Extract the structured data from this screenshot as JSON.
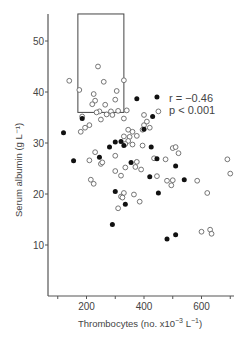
{
  "chart_data": {
    "type": "scatter",
    "title": "",
    "xlabel": "Thrombocytes (no. x10⁻³ L⁻¹)",
    "ylabel": "Serum albumin (g L⁻¹)",
    "xlim": [
      0,
      900
    ],
    "ylim": [
      0,
      55
    ],
    "xticks": [
      200,
      400,
      600,
      800
    ],
    "yticks": [
      10,
      20,
      30,
      40,
      50
    ],
    "grid": false,
    "legend": null,
    "annotations": [
      "r = −0.46",
      "p < 0.001"
    ],
    "reference_box": {
      "x_min": 170,
      "x_max": 330,
      "y_min": 36,
      "y_max": 55.3
    },
    "series": [
      {
        "name": "open circles",
        "marker": "open",
        "points": [
          [
            140,
            42.2
          ],
          [
            175,
            40.4
          ],
          [
            240,
            45
          ],
          [
            260,
            42
          ],
          [
            330,
            42.3
          ],
          [
            225,
            39.6
          ],
          [
            230,
            38.3
          ],
          [
            220,
            37.6
          ],
          [
            265,
            37.5
          ],
          [
            305,
            40.2
          ],
          [
            300,
            38.5
          ],
          [
            245,
            36.2
          ],
          [
            235,
            36
          ],
          [
            285,
            36.2
          ],
          [
            310,
            36.3
          ],
          [
            270,
            35.6
          ],
          [
            290,
            35.5
          ],
          [
            185,
            35.2
          ],
          [
            210,
            33.5
          ],
          [
            195,
            33
          ],
          [
            180,
            32.2
          ],
          [
            250,
            34.6
          ],
          [
            330,
            34.8
          ],
          [
            340,
            36.4
          ],
          [
            450,
            36.2
          ],
          [
            400,
            33.5
          ],
          [
            420,
            33
          ],
          [
            345,
            32.6
          ],
          [
            330,
            31.3
          ],
          [
            350,
            31.2
          ],
          [
            345,
            30.4
          ],
          [
            375,
            31.4
          ],
          [
            335,
            29.8
          ],
          [
            360,
            29.7
          ],
          [
            395,
            29.5
          ],
          [
            300,
            27.5
          ],
          [
            230,
            28.2
          ],
          [
            210,
            26.6
          ],
          [
            250,
            25.9
          ],
          [
            255,
            26.2
          ],
          [
            300,
            24.5
          ],
          [
            335,
            25.2
          ],
          [
            370,
            25.3
          ],
          [
            375,
            26.3
          ],
          [
            390,
            24.8
          ],
          [
            435,
            27
          ],
          [
            475,
            26.8
          ],
          [
            500,
            29
          ],
          [
            520,
            28
          ],
          [
            445,
            23.5
          ],
          [
            480,
            22.6
          ],
          [
            500,
            22.7
          ],
          [
            495,
            21.7
          ],
          [
            585,
            22.6
          ],
          [
            690,
            26.8
          ],
          [
            700,
            24
          ],
          [
            215,
            22.8
          ],
          [
            225,
            22
          ],
          [
            320,
            23.6
          ],
          [
            330,
            20.2
          ],
          [
            320,
            19.5
          ],
          [
            325,
            19.3
          ],
          [
            365,
            19.9
          ],
          [
            310,
            17.2
          ],
          [
            385,
            18.5
          ],
          [
            510,
            29.2
          ],
          [
            360,
            32.2
          ],
          [
            395,
            32.6
          ],
          [
            620,
            20.2
          ],
          [
            600,
            12.6
          ],
          [
            630,
            13
          ],
          [
            635,
            12.2
          ],
          [
            400,
            35.5
          ],
          [
            410,
            34.2
          ]
        ]
      },
      {
        "name": "filled circles",
        "marker": "filled",
        "points": [
          [
            120,
            32
          ],
          [
            185,
            34.8
          ],
          [
            280,
            29.2
          ],
          [
            300,
            30.2
          ],
          [
            320,
            30.3
          ],
          [
            330,
            29.5
          ],
          [
            375,
            38.7
          ],
          [
            445,
            39
          ],
          [
            430,
            35.2
          ],
          [
            400,
            32.7
          ],
          [
            425,
            29.2
          ],
          [
            155,
            26.5
          ],
          [
            245,
            27.2
          ],
          [
            355,
            26.2
          ],
          [
            420,
            23.4
          ],
          [
            445,
            26.9
          ],
          [
            510,
            25.5
          ],
          [
            540,
            22.8
          ],
          [
            450,
            20.2
          ],
          [
            300,
            20.5
          ],
          [
            290,
            14
          ],
          [
            480,
            11.2
          ],
          [
            510,
            12
          ],
          [
            740,
            12
          ],
          [
            335,
            18
          ]
        ]
      }
    ]
  },
  "labels": {
    "ylabel": "Serum albumin (g L⁻¹)",
    "xlabel_main": "Thrombocytes (no. x10",
    "xlabel_sup1": "−3",
    "xlabel_mid": " L",
    "xlabel_sup2": "−1",
    "xlabel_end": ")",
    "annot_r": "r = −0.46",
    "annot_p": "p < 0.001"
  },
  "colors": {
    "axis": "#555555",
    "open_stroke": "#666666",
    "filled": "#111111",
    "box": "#444444"
  }
}
